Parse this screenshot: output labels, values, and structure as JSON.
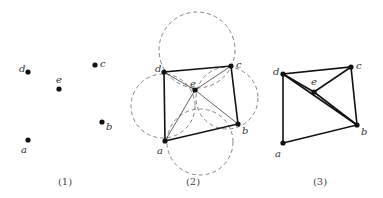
{
  "panels": [
    {
      "caption": "(1)",
      "points": {
        "a": {
          "label": "a",
          "x": 28,
          "y": 140
        },
        "b": {
          "label": "b",
          "x": 102,
          "y": 122
        },
        "c": {
          "label": "c",
          "x": 95,
          "y": 65
        },
        "d": {
          "label": "d",
          "x": 28,
          "y": 72
        },
        "e": {
          "label": "e",
          "x": 59,
          "y": 89
        }
      }
    },
    {
      "caption": "(2)",
      "points": {
        "a": {
          "label": "a",
          "x": 165,
          "y": 141
        },
        "b": {
          "label": "b",
          "x": 238,
          "y": 124
        },
        "c": {
          "label": "c",
          "x": 231,
          "y": 66
        },
        "d": {
          "label": "d",
          "x": 164,
          "y": 72
        },
        "e": {
          "label": "e",
          "x": 195,
          "y": 90
        }
      },
      "hull_edges": [
        [
          "a",
          "b"
        ],
        [
          "b",
          "c"
        ],
        [
          "c",
          "d"
        ],
        [
          "d",
          "a"
        ]
      ],
      "interior_edges": [
        [
          "e",
          "a"
        ],
        [
          "e",
          "b"
        ],
        [
          "e",
          "c"
        ],
        [
          "e",
          "d"
        ]
      ],
      "circles": [
        {
          "cx": 197,
          "cy": 50,
          "r": 38
        },
        {
          "cx": 163,
          "cy": 106,
          "r": 32
        },
        {
          "cx": 227,
          "cy": 98,
          "r": 31
        },
        {
          "cx": 200,
          "cy": 142,
          "r": 33
        }
      ]
    },
    {
      "caption": "(3)",
      "points": {
        "a": {
          "label": "a",
          "x": 283,
          "y": 143
        },
        "b": {
          "label": "b",
          "x": 357,
          "y": 125
        },
        "c": {
          "label": "c",
          "x": 351,
          "y": 67
        },
        "d": {
          "label": "d",
          "x": 283,
          "y": 74
        },
        "e": {
          "label": "e",
          "x": 314,
          "y": 92
        }
      },
      "edges": [
        [
          "a",
          "b"
        ],
        [
          "b",
          "c"
        ],
        [
          "c",
          "d"
        ],
        [
          "d",
          "a"
        ],
        [
          "d",
          "b"
        ],
        [
          "d",
          "e"
        ],
        [
          "e",
          "b"
        ],
        [
          "e",
          "c"
        ]
      ]
    }
  ]
}
